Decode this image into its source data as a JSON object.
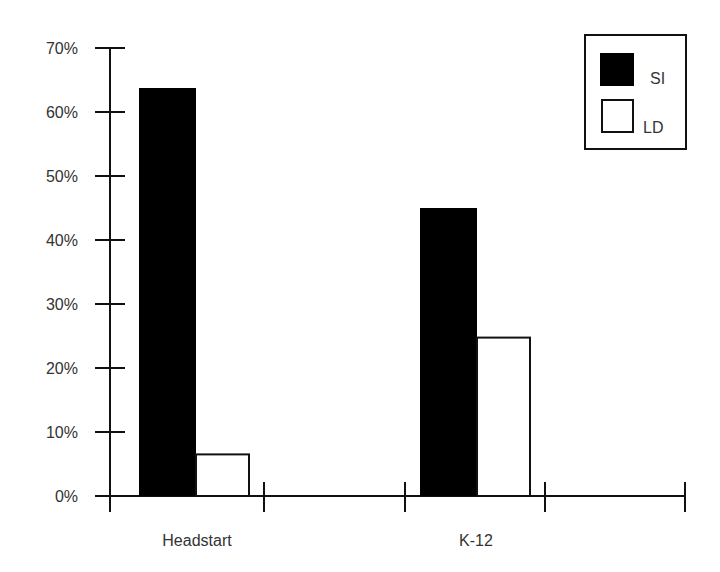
{
  "chart_data": {
    "type": "bar",
    "title": "",
    "xlabel": "",
    "ylabel": "",
    "categories": [
      "Headstart",
      "K-12"
    ],
    "series": [
      {
        "name": "SI",
        "values": [
          63.75,
          45
        ],
        "color": "#000000"
      },
      {
        "name": "LD",
        "values": [
          6.5,
          24.75
        ],
        "color": "#ffffff"
      }
    ],
    "ylim": [
      0,
      70
    ],
    "yticks": [
      "0%",
      "10%",
      "20%",
      "30%",
      "40%",
      "50%",
      "60%",
      "70%"
    ],
    "grid": false,
    "legend_position": "top-right"
  },
  "legend": {
    "items": [
      {
        "label": "SI"
      },
      {
        "label": "LD"
      }
    ]
  },
  "axis": {
    "y_ticks": [
      "0%",
      "10%",
      "20%",
      "30%",
      "40%",
      "50%",
      "60%",
      "70%"
    ],
    "x_labels": [
      "Headstart",
      "K-12"
    ]
  }
}
